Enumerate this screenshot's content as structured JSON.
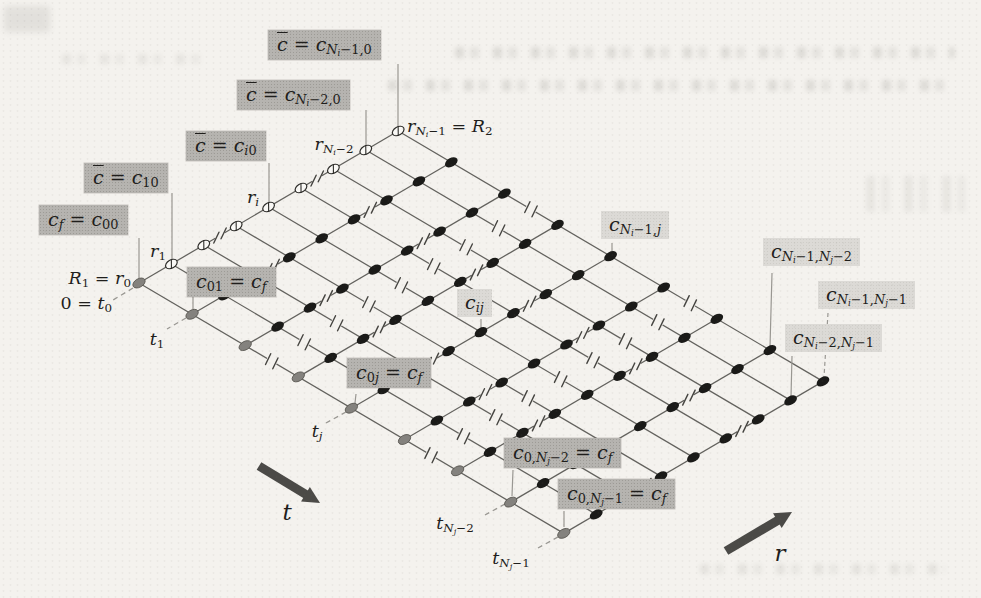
{
  "canvas": {
    "width": 981,
    "height": 598,
    "background": "#f4f2ee"
  },
  "colors": {
    "grid_line": "#63625e",
    "leader_line": "#999792",
    "node_black": "#1a1a18",
    "node_gray_fill": "#84827e",
    "node_gray_stroke": "#56544f",
    "node_open_fill": "#faf9f6",
    "node_open_stroke": "#2f2e2b",
    "break_mark": "#454440",
    "box_dark_bg": "#b6b4b0",
    "box_light_bg": "#dcdad6",
    "label_text": "#1f1e1c",
    "arrow": "#4b4a47"
  },
  "grid": {
    "origin": [
      139,
      283
    ],
    "r_step": [
      32.4,
      -19.0
    ],
    "t_step": [
      53.1,
      31.3
    ],
    "cols": 9,
    "rows": 9,
    "col_break_gaps": [
      2,
      5
    ],
    "row_break_gaps": [
      2,
      5
    ],
    "node_tilt_deg": -30.4
  },
  "labels": {
    "boxed_dark": [
      {
        "name": "label-cbar-eq-cNi-1-0",
        "m": "@{c} = c_{N_{i}−1,0}",
        "x": 268,
        "y": 30
      },
      {
        "name": "label-cbar-eq-cNi-2-0",
        "m": "@{c} = c_{N_{i}−2,0}",
        "x": 237,
        "y": 80
      },
      {
        "name": "label-cbar-eq-ci0",
        "m": "@{c} = c_{i0}",
        "x": 186,
        "y": 131
      },
      {
        "name": "label-cbar-eq-c10",
        "m": "@{c} = c_{10}",
        "x": 84,
        "y": 163
      },
      {
        "name": "label-cf-eq-c00",
        "m": "c_{f} = c_{00}",
        "x": 39,
        "y": 205
      },
      {
        "name": "label-c01-eq-cf",
        "m": "c_{01} = c_{f}",
        "x": 187,
        "y": 267
      },
      {
        "name": "label-c0j-eq-cf",
        "m": "c_{0j} = c_{f}",
        "x": 347,
        "y": 358
      },
      {
        "name": "label-c0Nj-2-eq-cf",
        "m": "c_{0,N_{j}−2} = c_{f}",
        "x": 504,
        "y": 438
      },
      {
        "name": "label-c0Nj-1-eq-cf",
        "m": "c_{0,N_{j}−1} = c_{f}",
        "x": 558,
        "y": 479
      }
    ],
    "boxed_light": [
      {
        "name": "label-cij",
        "m": "c_{ij}",
        "x": 457,
        "y": 289
      },
      {
        "name": "label-cNi-1-j",
        "m": "c_{N_{i}−1,j}",
        "x": 601,
        "y": 211
      },
      {
        "name": "label-cNi-1-Nj-2",
        "m": "c_{N_{i}−1,N_{j}−2}",
        "x": 763,
        "y": 238
      },
      {
        "name": "label-cNi-1-Nj-1",
        "m": "c_{N_{i}−1,N_{j}−1}",
        "x": 818,
        "y": 281
      },
      {
        "name": "label-cNi-2-Nj-1",
        "m": "c_{N_{i}−2,N_{j}−1}",
        "x": 785,
        "y": 324
      }
    ],
    "plain": [
      {
        "name": "tick-R1-r0",
        "m": "R_{1} = r_{0}",
        "x": 131,
        "y": 279,
        "anchor": "right"
      },
      {
        "name": "tick-0-t0",
        "m": "0 = t_{0}",
        "x": 112,
        "y": 304,
        "anchor": "right"
      },
      {
        "name": "tick-r1",
        "m": "r_{1}",
        "x": 158,
        "y": 252,
        "anchor": "center"
      },
      {
        "name": "tick-ri",
        "m": "r_{i}",
        "x": 253,
        "y": 198,
        "anchor": "center"
      },
      {
        "name": "tick-rNi-2",
        "m": "r_{N_{i}−2}",
        "x": 334,
        "y": 145,
        "anchor": "center"
      },
      {
        "name": "tick-rNi-1-R2",
        "m": "r_{N_{i}−1} = R_{2}",
        "x": 407,
        "y": 127,
        "anchor": "left"
      },
      {
        "name": "tick-t1",
        "m": "t_{1}",
        "x": 157,
        "y": 340,
        "anchor": "center"
      },
      {
        "name": "tick-tj",
        "m": "t_{j}",
        "x": 317,
        "y": 432,
        "anchor": "center"
      },
      {
        "name": "tick-tNj-2",
        "m": "t_{N_{j}−2}",
        "x": 455,
        "y": 524,
        "anchor": "center"
      },
      {
        "name": "tick-tNj-1",
        "m": "t_{N_{j}−1}",
        "x": 511,
        "y": 559,
        "anchor": "center"
      },
      {
        "name": "axis-label-t",
        "m": "t",
        "x": 287,
        "y": 513,
        "anchor": "center",
        "big": true
      },
      {
        "name": "axis-label-r",
        "m": "r",
        "x": 780,
        "y": 554,
        "anchor": "center",
        "big": true
      }
    ]
  },
  "leaders": {
    "solid": [
      [
        398,
        64,
        398,
        126
      ],
      [
        366,
        110,
        366,
        146
      ],
      [
        269,
        163,
        269,
        203
      ],
      [
        172,
        193,
        172,
        259
      ],
      [
        139,
        238,
        139,
        278
      ],
      [
        193,
        297,
        193,
        309
      ],
      [
        356,
        394,
        355,
        403
      ],
      [
        513,
        470,
        512,
        496
      ],
      [
        564,
        511,
        564,
        527
      ],
      [
        481,
        319,
        481,
        328
      ],
      [
        612,
        243,
        612,
        251
      ],
      [
        772,
        273,
        770,
        347
      ],
      [
        792,
        356,
        791,
        397
      ]
    ],
    "dashed": [
      [
        828,
        313,
        824,
        377
      ]
    ]
  },
  "axis_ticks_dashed": [
    [
      133,
      288,
      113,
      300
    ],
    [
      186,
      318,
      167,
      329
    ],
    [
      346,
      412,
      326,
      423
    ],
    [
      505,
      504,
      485,
      515
    ],
    [
      558,
      537,
      538,
      548
    ]
  ],
  "arrows": [
    {
      "name": "t-axis-arrow",
      "from": [
        259,
        466
      ],
      "to": [
        320,
        503
      ]
    },
    {
      "name": "r-axis-arrow",
      "from": [
        726,
        551
      ],
      "to": [
        792,
        512
      ]
    }
  ]
}
